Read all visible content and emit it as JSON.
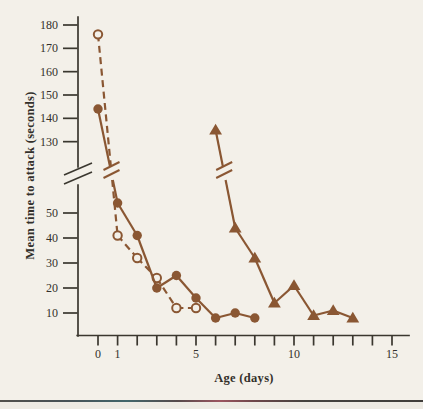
{
  "page": {
    "background_color": "#f3f0e9"
  },
  "chart_data": {
    "type": "line",
    "title": "",
    "xlabel": "Age (days)",
    "ylabel": "Mean time to attack (seconds)",
    "x_axis": {
      "min": 0,
      "max": 15,
      "tick_step": 1,
      "labeled_ticks": [
        0,
        1,
        5,
        10,
        15
      ]
    },
    "y_axis": {
      "broken": true,
      "lower_ticks": [
        10,
        20,
        30,
        40,
        50
      ],
      "upper_ticks": [
        130,
        140,
        150,
        160,
        170,
        180
      ],
      "lower_range": [
        0,
        60
      ],
      "upper_range": [
        125,
        185
      ]
    },
    "series": [
      {
        "name": "group-open-circles",
        "marker": "open-circle",
        "line_style": "dashed",
        "points": [
          [
            0,
            176
          ],
          [
            1,
            41
          ],
          [
            2,
            32
          ],
          [
            3,
            24
          ],
          [
            4,
            12
          ],
          [
            5,
            12
          ]
        ]
      },
      {
        "name": "group-filled-circles",
        "marker": "filled-circle",
        "line_style": "solid",
        "points": [
          [
            0,
            144
          ],
          [
            1,
            54
          ],
          [
            2,
            41
          ],
          [
            3,
            20
          ],
          [
            4,
            25
          ],
          [
            5,
            16
          ],
          [
            6,
            8
          ],
          [
            7,
            10
          ],
          [
            8,
            8
          ]
        ]
      },
      {
        "name": "group-filled-triangles",
        "marker": "filled-triangle",
        "line_style": "solid",
        "points": [
          [
            6,
            135
          ],
          [
            7,
            44
          ],
          [
            8,
            32
          ],
          [
            9,
            14
          ],
          [
            10,
            21
          ],
          [
            11,
            9
          ],
          [
            12,
            11
          ],
          [
            13,
            8
          ]
        ]
      }
    ],
    "colors": {
      "data": "#8a5733",
      "axis": "#3a372f",
      "text": "#33302b"
    },
    "legend": "none",
    "grid": false
  }
}
